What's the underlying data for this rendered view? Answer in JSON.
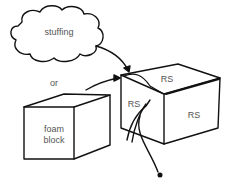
{
  "diagram": {
    "cloud": {
      "label": "stuffing"
    },
    "connector": {
      "label": "or"
    },
    "foam_block": {
      "label_line1": "foam",
      "label_line2": "block"
    },
    "cushion": {
      "top_label": "RS",
      "left_label": "RS",
      "right_label": "RS"
    },
    "colors": {
      "stroke": "#111111",
      "text": "#555555",
      "background": "#ffffff"
    }
  }
}
